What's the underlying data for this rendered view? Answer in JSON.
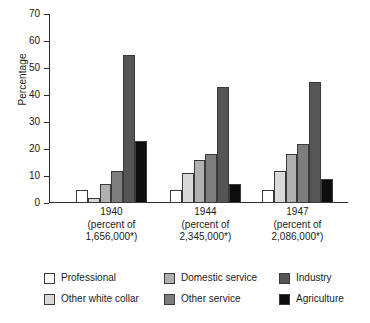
{
  "chart_data": {
    "type": "bar",
    "title": "",
    "xlabel": "",
    "ylabel": "Percentage",
    "ylim": [
      0,
      70
    ],
    "yticks": [
      0,
      10,
      20,
      30,
      40,
      50,
      60,
      70
    ],
    "grid": false,
    "legend_position": "bottom",
    "categories": [
      "1940",
      "1944",
      "1947"
    ],
    "category_sublabels": [
      {
        "line1": "(percent of",
        "line2": "1,656,000*)"
      },
      {
        "line1": "(percent of",
        "line2": "2,345,000*)"
      },
      {
        "line1": "(percent of",
        "line2": "2,086,000*)"
      }
    ],
    "series": [
      {
        "name": "Professional",
        "color": "#ffffff",
        "values": [
          5,
          5,
          5
        ]
      },
      {
        "name": "Other white collar",
        "color": "#d9d9d9",
        "values": [
          2,
          11,
          12
        ]
      },
      {
        "name": "Domestic service",
        "color": "#b0b0b0",
        "values": [
          7,
          16,
          18
        ]
      },
      {
        "name": "Other service",
        "color": "#7d7d7d",
        "values": [
          12,
          18,
          22
        ]
      },
      {
        "name": "Industry",
        "color": "#555555",
        "values": [
          55,
          43,
          45
        ]
      },
      {
        "name": "Agriculture",
        "color": "#0d0d0d",
        "values": [
          23,
          7,
          9
        ]
      }
    ]
  },
  "axis": {
    "y_title": "Percentage",
    "y_tick_labels": [
      "0",
      "10",
      "20",
      "30",
      "40",
      "50",
      "60",
      "70"
    ]
  },
  "legend": {
    "items": [
      {
        "label": "Professional",
        "color": "#ffffff"
      },
      {
        "label": "Other white collar",
        "color": "#d9d9d9"
      },
      {
        "label": "Domestic service",
        "color": "#b0b0b0"
      },
      {
        "label": "Other service",
        "color": "#7d7d7d"
      },
      {
        "label": "Industry",
        "color": "#555555"
      },
      {
        "label": "Agriculture",
        "color": "#0d0d0d"
      }
    ]
  }
}
